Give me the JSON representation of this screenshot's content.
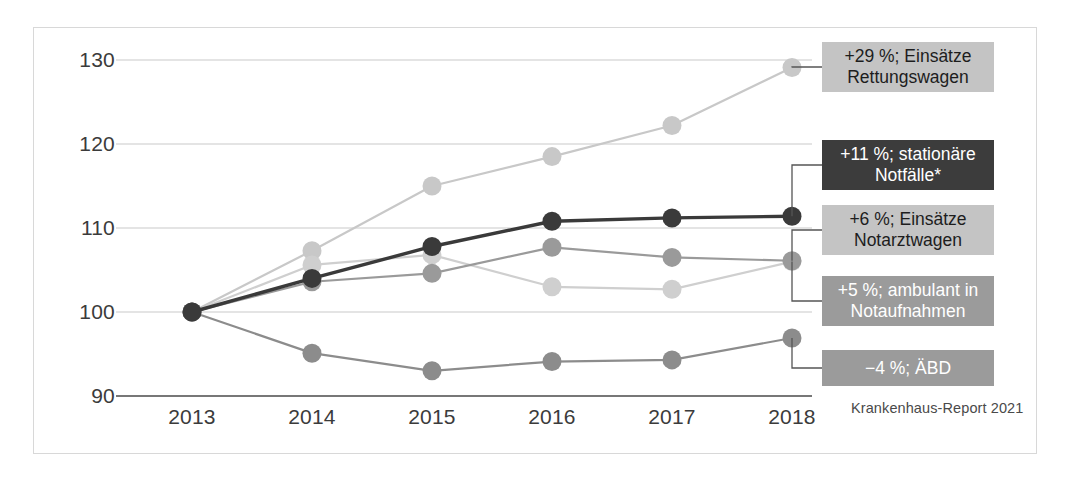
{
  "figure": {
    "source_note": "Krankenhaus-Report 2021"
  },
  "axis": {
    "y_ticks": [
      "130",
      "120",
      "110",
      "100",
      "90"
    ],
    "x_ticks": [
      "2013",
      "2014",
      "2015",
      "2016",
      "2017",
      "2018"
    ]
  },
  "callouts": [
    {
      "id": "rettungswagen",
      "line1": "+29 %; Einsätze",
      "line2": "Rettungswagen",
      "style": "light"
    },
    {
      "id": "stationaere",
      "line1": "+11 %; stationäre",
      "line2": "Notfälle*",
      "style": "dark"
    },
    {
      "id": "notarztwagen",
      "line1": "+6 %; Einsätze",
      "line2": "Notarztwagen",
      "style": "light"
    },
    {
      "id": "ambulant",
      "line1": "+5 %; ambulant in",
      "line2": "Notaufnahmen",
      "style": "mid"
    },
    {
      "id": "aebd",
      "line1": "−4 %; ÄBD",
      "line2": "",
      "style": "mid"
    }
  ],
  "chart_data": {
    "type": "line",
    "title": "",
    "subtitle": "",
    "xlabel": "",
    "ylabel": "",
    "x": [
      2013,
      2014,
      2015,
      2016,
      2017,
      2018
    ],
    "categories": [
      "2013",
      "2014",
      "2015",
      "2016",
      "2017",
      "2018"
    ],
    "ylim": [
      90,
      130
    ],
    "y_ticks": [
      90,
      100,
      110,
      120,
      130
    ],
    "grid": "horizontal",
    "legend_position": "right-callouts",
    "index_base": "2013 = 100",
    "series": [
      {
        "name": "Einsätze Rettungswagen",
        "label": "+29 %; Einsätze Rettungswagen",
        "change_percent": 29,
        "color": "#c8c8c8",
        "values": [
          100,
          107.3,
          115,
          118.5,
          122.2,
          129.1
        ]
      },
      {
        "name": "stationäre Notfälle*",
        "label": "+11 %; stationäre Notfälle*",
        "change_percent": 11,
        "color": "#3a3a3a",
        "values": [
          100,
          104,
          107.8,
          110.8,
          111.2,
          111.4
        ]
      },
      {
        "name": "Einsätze Notarztwagen",
        "label": "+6 %; Einsätze Notarztwagen",
        "change_percent": 6,
        "color": "#9a9a9a",
        "values": [
          100,
          103.6,
          104.6,
          107.7,
          106.5,
          106.1
        ]
      },
      {
        "name": "ambulant in Notaufnahmen",
        "label": "+5 %; ambulant in Notaufnahmen",
        "change_percent": 5,
        "color": "#cfcfcf",
        "values": [
          100,
          105.6,
          106.8,
          103,
          102.7,
          106
        ]
      },
      {
        "name": "ÄBD",
        "label": "−4 %; ÄBD",
        "change_percent": -4,
        "color": "#8c8c8c",
        "values": [
          100,
          95.1,
          93,
          94.1,
          94.3,
          96.9
        ]
      }
    ],
    "annotations": [
      "Krankenhaus-Report 2021"
    ]
  }
}
